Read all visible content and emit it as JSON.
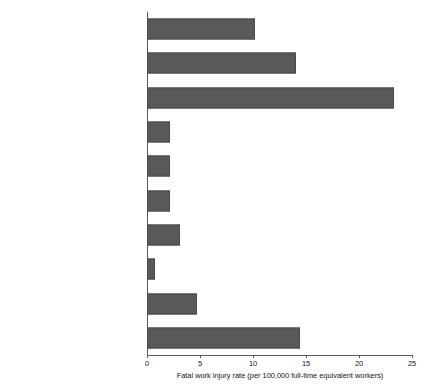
{
  "chart_data": {
    "type": "bar",
    "orientation": "horizontal",
    "title": "",
    "subtitle": "",
    "xlabel": "Fatal work injury rate (per 100,000 full-time equivalent workers)",
    "ylabel": "",
    "xlim": [
      0,
      25
    ],
    "ylim": null,
    "xticks": [
      0,
      5,
      10,
      15,
      20,
      25
    ],
    "xtick_labels": [
      "0",
      "5",
      "10",
      "15",
      "20",
      "25"
    ],
    "grid": false,
    "legend": false,
    "legend_position": "none",
    "bar_color": "#595959",
    "categories": [
      "Construction",
      "Transportation and warehousing",
      "Agriculture, forestry, fishing, and hunting",
      "Government",
      "Retail trade",
      "Leisure and hospitality",
      "Other services (exc. Public admin.)",
      "Educational and health services",
      "Wholesale trade",
      "Mining, quarrying, and oil and gas\nextraction"
    ],
    "values": [
      10.2,
      14.1,
      23.3,
      2.2,
      2.2,
      2.2,
      3.1,
      0.8,
      4.7,
      14.4
    ]
  }
}
